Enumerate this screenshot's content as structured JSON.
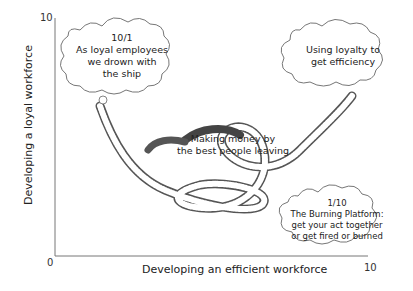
{
  "diagram": {
    "axes": {
      "x_label": "Developing an efficient workforce",
      "y_label": "Developing a loyal workforce",
      "origin_label": "0",
      "x_max_label": "10",
      "y_max_label": "10"
    },
    "bubbles": [
      {
        "id": "top-left",
        "lines": [
          "10/1",
          "As loyal employees",
          "we drown with",
          "the ship"
        ]
      },
      {
        "id": "top-right",
        "lines": [
          "Using loyalty to",
          "get efficiency"
        ]
      },
      {
        "id": "center",
        "lines": [
          "Making money by",
          "the best people leaving"
        ]
      },
      {
        "id": "bottom-right",
        "lines": [
          "1/10",
          "The Burning Platform:",
          "get your act together",
          "or get fired or burned"
        ]
      }
    ]
  }
}
